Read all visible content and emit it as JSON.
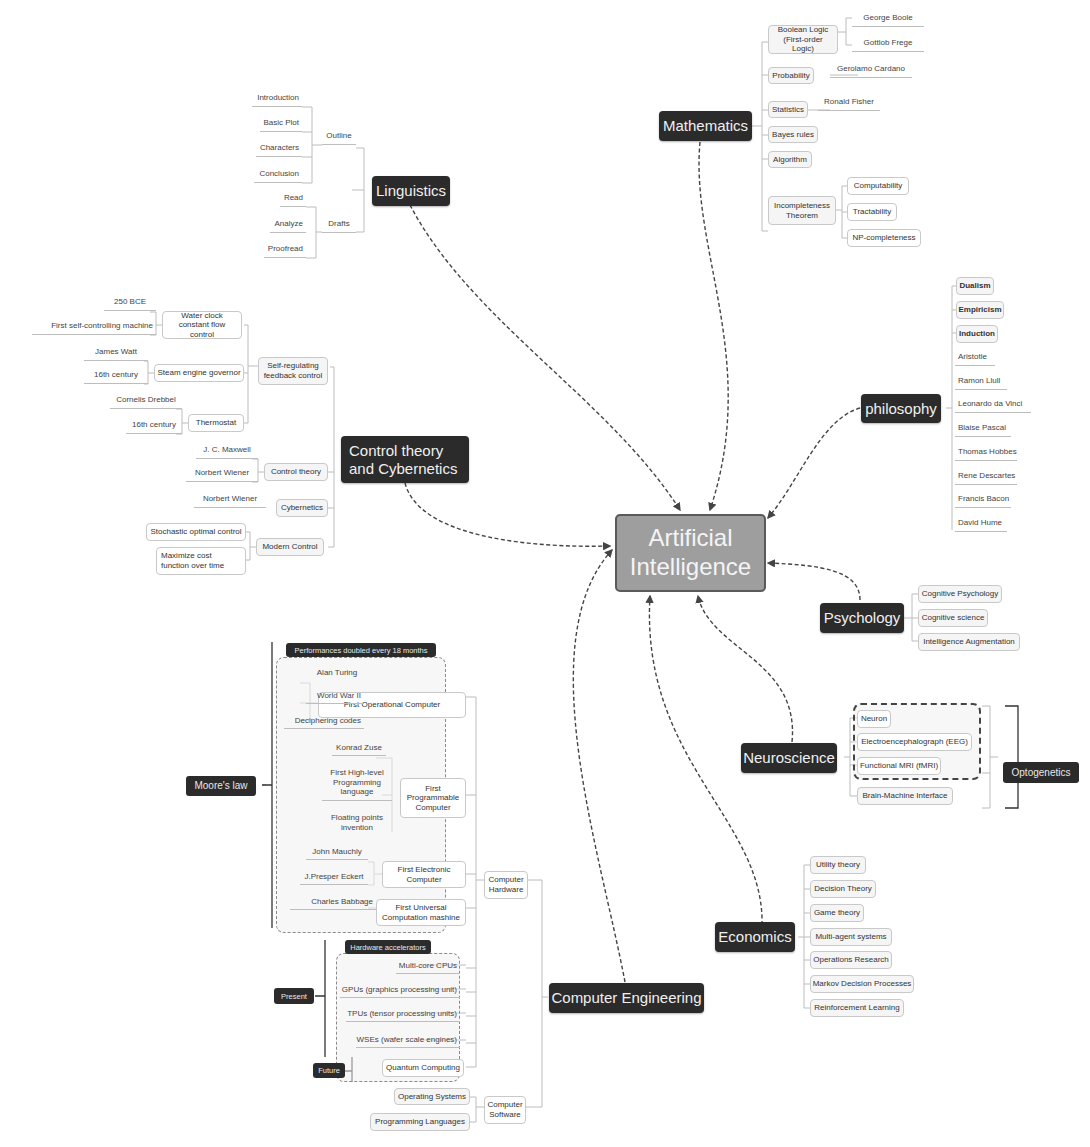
{
  "center": {
    "label": "Artificial Intelligence"
  },
  "mathematics": {
    "label": "Mathematics",
    "boolean_logic": "Boolean Logic (First-order Logic)",
    "george_boole": "George Boole",
    "gottlob_frege": "Gottlob Frege",
    "probability": "Probability",
    "gerolamo_cardano": "Gerolamo Cardano",
    "statistics": "Statistics",
    "ronald_fisher": "Ronald Fisher",
    "bayes_rules": "Bayes rules",
    "algorithm": "Algorithm",
    "incompleteness": "Incompleteness Theorem",
    "computability": "Computability",
    "tractability": "Tractability",
    "np_completeness": "NP-completeness"
  },
  "linguistics": {
    "label": "Linguistics",
    "outline": "Outline",
    "introduction": "Introduction",
    "basic_plot": "Basic Plot",
    "characters": "Characters",
    "conclusion": "Conclusion",
    "drafts": "Drafts",
    "read": "Read",
    "analyze": "Analyze",
    "proofread": "Proofread"
  },
  "control": {
    "label": "Control theory and Cybernetics",
    "self_regulating": "Self-regulating feedback control",
    "water_clock": "Water clock constant flow control",
    "bce_250": "250 BCE",
    "first_self_controlling": "First self-controlling machine",
    "steam_engine": "Steam engine governor",
    "james_watt": "James Watt",
    "century_16a": "16th century",
    "thermostat": "Thermostat",
    "cornelis_drebbel": "Cornelis Drebbel",
    "century_16b": "16th century",
    "control_theory": "Control theory",
    "jc_maxwell": "J. C. Maxwell",
    "norbert_wiener_a": "Norbert Wiener",
    "cybernetics": "Cybernetics",
    "norbert_wiener_b": "Norbert Wiener",
    "modern_control": "Modern Control",
    "stochastic": "Stochastic optimal control",
    "maximize": "Maximize cost function over time"
  },
  "philosophy": {
    "label": "philosophy",
    "items": [
      "Dualism",
      "Empiricism",
      "Induction",
      "Aristotle",
      "Ramon Llull",
      "Leonardo da Vinci",
      "Blaise Pascal",
      "Thomas Hobbes",
      "Rene Descartes",
      "Francis Bacon",
      "David Hume"
    ]
  },
  "psychology": {
    "label": "Psychology",
    "items": [
      "Cognitive Psychology",
      "Cognitive science",
      "Intelligence Augmentation"
    ]
  },
  "neuroscience": {
    "label": "Neuroscience",
    "items": [
      "Neuron",
      "Electroencephalograph (EEG)",
      "Functional MRI (fMRI)",
      "Brain-Machine Interface"
    ],
    "optogenetics": "Optogenetics"
  },
  "economics": {
    "label": "Economics",
    "items": [
      "Utility theory",
      "Decision Theory",
      "Game theory",
      "Multi-agent systems",
      "Operations Research",
      "Markov Decision Processes",
      "Reinforcement Learning"
    ]
  },
  "computer_engineering": {
    "label": "Computer Engineering",
    "hardware": "Computer Hardware",
    "software": "Computer Software",
    "moores_law": "Moore's law",
    "performance_tag": "Performances doubled every 18 months",
    "first_operational": "First Operational Computer",
    "alan_turing": "Alan Turing",
    "world_war_ii": "World War II",
    "deciphering": "Deciphering codes",
    "first_programmable": "First Programmable Computer",
    "konrad_zuse": "Konrad Zuse",
    "high_level": "First High-level Programming language",
    "floating_points": "Floating points invention",
    "first_electronic": "First Electronic Computer",
    "john_mauchly": "John Mauchly",
    "presper_eckert": "J.Presper Eckert",
    "first_universal": "First Universal Computation mashine",
    "charles_babbage": "Charles Babbage",
    "present": "Present",
    "future": "Future",
    "accelerators_tag": "Hardware accelerators",
    "multicore": "Multi-core CPUs",
    "gpus": "GPUs (graphics processing unit)",
    "tpus": "TPUs (tensor processing units)",
    "wses": "WSEs (wafer scale engines)",
    "quantum": "Quantum Computing",
    "operating_systems": "Operating Systems",
    "programming_languages": "Programming Languages"
  },
  "colors": {
    "main_node": "#2b2b2b",
    "center_node": "#9e9e9e",
    "sub_node_bg": "#f5f5f5",
    "connector": "#555555"
  }
}
